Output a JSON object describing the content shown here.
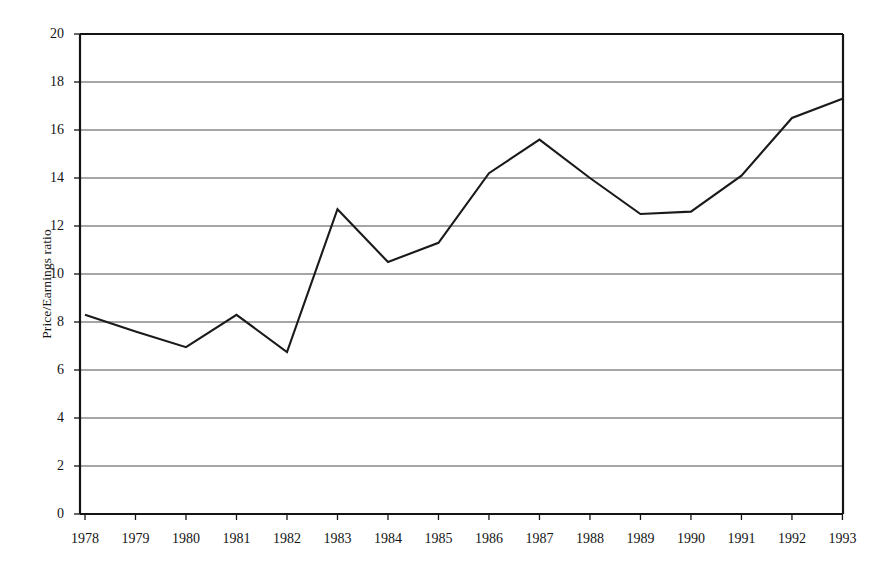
{
  "chart_data": {
    "type": "line",
    "title": "",
    "subtitle": "",
    "xlabel": "",
    "ylabel": "Price/Earnings ratio",
    "x": [
      "1978",
      "1979",
      "1980",
      "1981",
      "1982",
      "1983",
      "1984",
      "1985",
      "1986",
      "1987",
      "1988",
      "1989",
      "1990",
      "1991",
      "1992",
      "1993"
    ],
    "categories": [
      "1978",
      "1979",
      "1980",
      "1981",
      "1982",
      "1983",
      "1984",
      "1985",
      "1986",
      "1987",
      "1988",
      "1989",
      "1990",
      "1991",
      "1992",
      "1993"
    ],
    "values": [
      8.3,
      7.6,
      6.95,
      8.3,
      6.75,
      12.7,
      10.5,
      11.3,
      14.2,
      15.6,
      14.0,
      12.5,
      12.6,
      14.1,
      16.5,
      17.3
    ],
    "series": [
      {
        "name": "Price/Earnings ratio",
        "values": [
          8.3,
          7.6,
          6.95,
          8.3,
          6.75,
          12.7,
          10.5,
          11.3,
          14.2,
          15.6,
          14.0,
          12.5,
          12.6,
          14.1,
          16.5,
          17.3
        ]
      }
    ],
    "ylim": [
      0,
      20
    ],
    "ytick_values": [
      0,
      2,
      4,
      6,
      8,
      10,
      12,
      14,
      16,
      18,
      20
    ],
    "ytick_labels": [
      "0",
      "2",
      "4",
      "6",
      "8",
      "10",
      "12",
      "14",
      "16",
      "18",
      "20"
    ],
    "xtick_labels": [
      "1978",
      "1979",
      "1980",
      "1981",
      "1982",
      "1983",
      "1984",
      "1985",
      "1986",
      "1987",
      "1988",
      "1989",
      "1990",
      "1991",
      "1992",
      "1993"
    ],
    "grid": "horizontal",
    "legend": "none",
    "line_color": "#1a1a1a",
    "grid_color": "#4d4d4d",
    "frame_color": "#141414",
    "background_color": "#ffffff",
    "markers": "none"
  },
  "axes": {
    "y_title": "Price/Earnings ratio"
  }
}
